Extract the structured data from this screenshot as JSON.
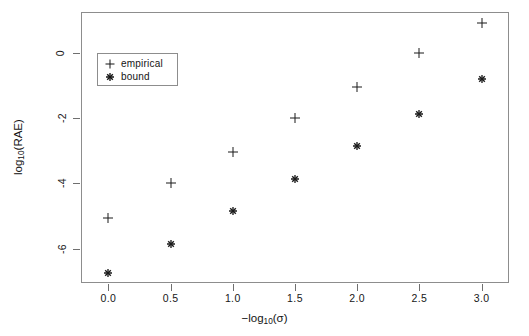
{
  "chart_data": {
    "type": "scatter",
    "title": "",
    "xlabel": "−log₁₀(σ)",
    "ylabel": "log₁₀(RAE)",
    "xlabel_parts": {
      "prefix": "−log",
      "sub": "10",
      "suffix": "(σ)"
    },
    "ylabel_parts": {
      "prefix": "log",
      "sub": "10",
      "suffix": "(RAE)"
    },
    "x": [
      0.0,
      0.5,
      1.0,
      1.5,
      2.0,
      2.5,
      3.0
    ],
    "xlim": [
      -0.22,
      3.22
    ],
    "ylim": [
      -7.05,
      1.25
    ],
    "xticks": [
      "0.0",
      "0.5",
      "1.0",
      "1.5",
      "2.0",
      "2.5",
      "3.0"
    ],
    "xtick_values": [
      0.0,
      0.5,
      1.0,
      1.5,
      2.0,
      2.5,
      3.0
    ],
    "yticks": [
      "0",
      "-2",
      "-4",
      "-6"
    ],
    "ytick_values": [
      0,
      -2,
      -4,
      -6
    ],
    "grid": false,
    "legend_position": "top-left",
    "series": [
      {
        "name": "empirical",
        "marker": "plus",
        "color": "#1a1a1a",
        "values": [
          -5.05,
          -4.0,
          -3.05,
          -2.0,
          -1.05,
          0.0,
          0.9
        ]
      },
      {
        "name": "bound",
        "marker": "asterisk",
        "color": "#1a1a1a",
        "values": [
          -6.75,
          -5.85,
          -4.85,
          -3.85,
          -2.85,
          -1.88,
          -0.8
        ]
      }
    ]
  },
  "legend": {
    "entries": [
      {
        "label": "empirical",
        "marker": "plus"
      },
      {
        "label": "bound",
        "marker": "asterisk"
      }
    ]
  }
}
